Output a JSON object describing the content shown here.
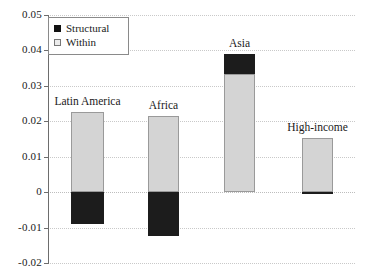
{
  "chart_data": {
    "type": "bar",
    "stacked": true,
    "title": "",
    "subtitle": "",
    "xlabel": "",
    "ylabel": "",
    "categories": [
      "Latin America",
      "Africa",
      "Asia",
      "High-income"
    ],
    "series": [
      {
        "name": "Within",
        "color": "#d4d4d4",
        "values": [
          0.0225,
          0.0215,
          0.0333,
          0.0153
        ]
      },
      {
        "name": "Structural",
        "color": "#1c1c1c",
        "values": [
          -0.009,
          -0.0125,
          0.0057,
          -0.0006
        ]
      }
    ],
    "bar_totals": [
      0.0135,
      0.009,
      0.039,
      0.0147
    ],
    "ylim": [
      -0.02,
      0.05
    ],
    "yticks": [
      0.05,
      0.04,
      0.03,
      0.02,
      0.01,
      0,
      -0.01,
      -0.02
    ],
    "ytick_labels": [
      "0.05",
      "0.04",
      "0.03",
      "0.02",
      "0.01",
      "0",
      "-0.01",
      "-0.02"
    ],
    "xticks": [],
    "xtick_labels": [],
    "grid": "horizontal-dotted",
    "legend_position": "top-left",
    "legend_entries": [
      "Structural",
      "Within"
    ],
    "annotations": [
      {
        "text": "Latin America",
        "category": "Latin America",
        "placement": "above-bar"
      },
      {
        "text": "Africa",
        "category": "Africa",
        "placement": "above-bar"
      },
      {
        "text": "Asia",
        "category": "Asia",
        "placement": "above-bar"
      },
      {
        "text": "High-income",
        "category": "High-income",
        "placement": "above-bar"
      }
    ]
  },
  "legend": {
    "items": [
      {
        "label": "Structural",
        "swatch": "filled-square-icon"
      },
      {
        "label": "Within",
        "swatch": "open-square-icon"
      }
    ]
  },
  "axes": {
    "y_tick_labels": [
      "0.05",
      "0.04",
      "0.03",
      "0.02",
      "0.01",
      "0",
      "-0.01",
      "-0.02"
    ]
  },
  "bars": [
    {
      "label": "Latin America"
    },
    {
      "label": "Africa"
    },
    {
      "label": "Asia"
    },
    {
      "label": "High-income"
    }
  ]
}
